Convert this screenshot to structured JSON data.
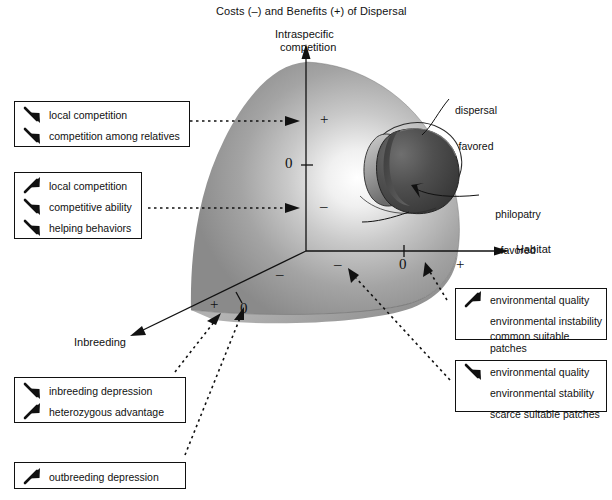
{
  "title": "Costs (–) and Benefits (+) of Dispersal",
  "axes": {
    "vertical": {
      "label_line1": "Intraspecific",
      "label_line2": "competition",
      "ticks": [
        "+",
        "0",
        "–"
      ]
    },
    "horizontal": {
      "label": "Habitat",
      "ticks": [
        "–",
        "0",
        "+"
      ]
    },
    "depth": {
      "label": "Inbreeding",
      "ticks": [
        "+",
        "0",
        "–"
      ]
    }
  },
  "callouts": [
    {
      "name": "dispersal-favored",
      "line1": "dispersal",
      "line2": "favored"
    },
    {
      "name": "philopatry-favored",
      "line1": "philopatry",
      "line2": "favored"
    }
  ],
  "boxes": [
    {
      "name": "intraspecific-competition-positive",
      "rows": [
        {
          "arrow": "down-right-arrow",
          "label": "local competition"
        },
        {
          "arrow": "down-right-arrow",
          "label": "competition among relatives"
        }
      ]
    },
    {
      "name": "intraspecific-competition-negative",
      "rows": [
        {
          "arrow": "up-right-arrow",
          "label": "local competition"
        },
        {
          "arrow": "down-right-arrow",
          "label": "competitive ability"
        },
        {
          "arrow": "down-right-arrow",
          "label": "helping behaviors"
        }
      ]
    },
    {
      "name": "inbreeding-positive",
      "rows": [
        {
          "arrow": "down-right-arrow",
          "label": "inbreeding depression"
        },
        {
          "arrow": "up-right-arrow",
          "label": "heterozygous advantage"
        }
      ]
    },
    {
      "name": "inbreeding-negative",
      "rows": [
        {
          "arrow": "up-right-arrow",
          "label": "outbreeding  depression"
        }
      ]
    },
    {
      "name": "habitat-positive",
      "rows": [
        {
          "arrow": "up-right-arrow",
          "label": "environmental quality"
        },
        {
          "arrow": "none",
          "label": "environmental instability"
        },
        {
          "arrow": "none",
          "label": "common suitable patches"
        }
      ]
    },
    {
      "name": "habitat-negative",
      "rows": [
        {
          "arrow": "down-right-arrow",
          "label": "environmental quality"
        },
        {
          "arrow": "none",
          "label": "environmental stability"
        },
        {
          "arrow": "none",
          "label": "scarce suitable patches"
        }
      ]
    }
  ],
  "colors": {
    "ink": "#111111",
    "surface_light": "#f2f2f2",
    "surface_mid": "#9a9a9a",
    "surface_dark": "#6e6e6e",
    "blob_dark": "#4a4a4a",
    "blob_darkest": "#3a3a3a"
  }
}
